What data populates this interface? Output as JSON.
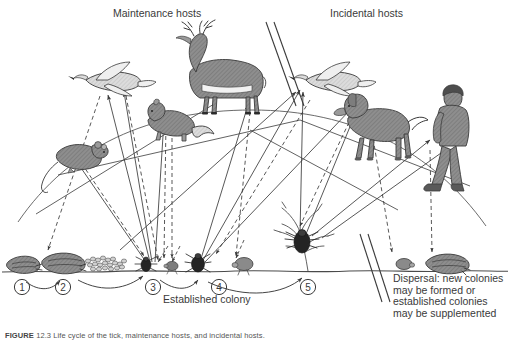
{
  "figure": {
    "domain": "Diagram",
    "kind": "tick-life-cycle-host-transmission-diagram",
    "background": "#ffffff",
    "ink": "#3a3a3a",
    "fill_body": "#8e8e8e",
    "fill_light": "#d8d8d8",
    "fill_dark": "#2b2b2b"
  },
  "labels": {
    "maintenance_hosts": "Maintenance hosts",
    "incidental_hosts": "Incidental hosts",
    "established_colony": "Established colony",
    "dispersal": "Dispersal: new colonies may be formed or established colonies may be supplemented"
  },
  "caption": {
    "prefix": "FIGURE",
    "number": "12.3",
    "text": "Life cycle of the tick, maintenance hosts, and incidental hosts."
  },
  "stages": [
    {
      "n": "1",
      "label": "①",
      "name": "engorged-female-tick",
      "cx": 22,
      "cy": 287,
      "body_x": 22,
      "body_y": 264
    },
    {
      "n": "2",
      "label": "②",
      "name": "ovipositing-female-tick",
      "cx": 63,
      "cy": 287,
      "body_x": 63,
      "body_y": 263
    },
    {
      "n": "3",
      "label": "③",
      "name": "larva",
      "cx": 153,
      "cy": 287,
      "body_x": 146,
      "body_y": 262
    },
    {
      "n": "4",
      "label": "④",
      "name": "nymph",
      "cx": 219,
      "cy": 287,
      "body_x": 197,
      "body_y": 263
    },
    {
      "n": "5",
      "label": "⑤",
      "name": "questing-adult-tick",
      "cx": 308,
      "cy": 287,
      "body_x": 286,
      "body_y": 232
    }
  ],
  "hosts": [
    {
      "name": "bird-left",
      "label": "bird",
      "group": "maintenance"
    },
    {
      "name": "squirrel",
      "label": "squirrel",
      "group": "maintenance"
    },
    {
      "name": "mouse",
      "label": "mouse",
      "group": "maintenance"
    },
    {
      "name": "deer",
      "label": "deer",
      "group": "maintenance"
    },
    {
      "name": "bird-right",
      "label": "bird",
      "group": "incidental"
    },
    {
      "name": "dog",
      "label": "dog",
      "group": "incidental"
    },
    {
      "name": "human",
      "label": "human",
      "group": "incidental"
    }
  ],
  "legend_lines": {
    "solid": "tick attaches to host",
    "dashed": "engorged tick drops from host to ground"
  }
}
